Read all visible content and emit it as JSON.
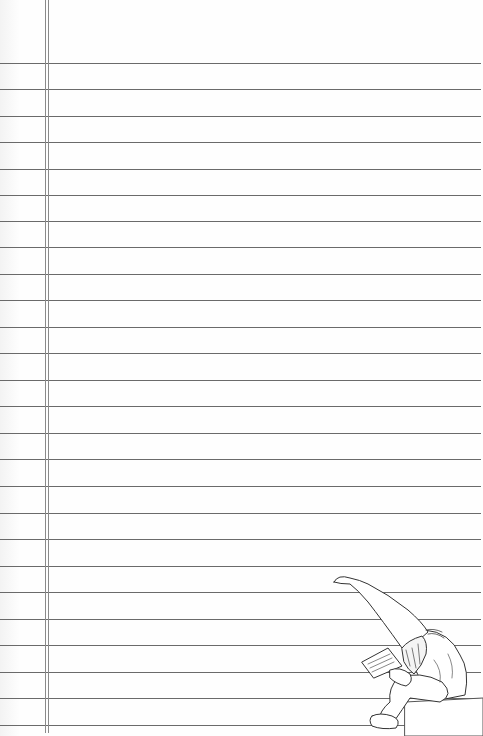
{
  "document": {
    "type": "lined-paper",
    "width": 483,
    "height": 736,
    "background_color": "#fefefe",
    "line_color": "#6a6a6a",
    "margin_line_color": "#8a8a8a",
    "rule_lines_y": [
      63,
      89,
      116,
      142,
      169,
      195,
      221,
      247,
      274,
      300,
      327,
      353,
      380,
      406,
      433,
      459,
      486,
      513,
      539,
      566,
      592,
      619,
      645,
      672,
      698,
      725
    ],
    "margin_lines_x": [
      45,
      48
    ],
    "illustration": {
      "subject": "gnome-reading-book",
      "description": "Gnome with tall pointed hat sitting on a block, reading a book"
    }
  }
}
